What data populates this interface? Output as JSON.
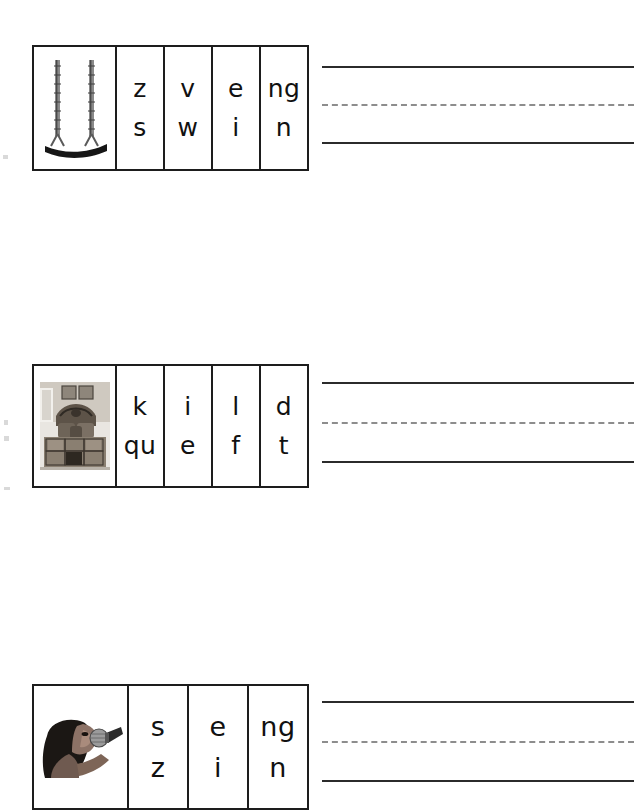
{
  "page": {
    "background_color": "#ffffff",
    "width": 644,
    "height": 812
  },
  "styles": {
    "box_border_color": "#1d1d1d",
    "solid_rule_color": "#2b2b2b",
    "dashed_rule_color": "#8d8d8d",
    "letter_color": "#111111"
  },
  "rows": [
    {
      "id": "row-1",
      "picture": {
        "icon": "swing-photo",
        "alt": "playground swing with chains"
      },
      "answer": "swing",
      "cells": [
        {
          "top": "z",
          "bottom": "s"
        },
        {
          "top": "v",
          "bottom": "w"
        },
        {
          "top": "e",
          "bottom": "i"
        },
        {
          "top": "ng",
          "bottom": "n"
        }
      ],
      "writing_lines": {
        "top": "",
        "middle": "",
        "bottom": ""
      }
    },
    {
      "id": "row-2",
      "picture": {
        "icon": "quilt-bed-photo",
        "alt": "bed with patchwork quilt and pillows"
      },
      "answer": "quilt",
      "cells": [
        {
          "top": "k",
          "bottom": "qu"
        },
        {
          "top": "i",
          "bottom": "e"
        },
        {
          "top": "l",
          "bottom": "f"
        },
        {
          "top": "d",
          "bottom": "t"
        }
      ],
      "writing_lines": {
        "top": "",
        "middle": "",
        "bottom": ""
      }
    },
    {
      "id": "row-3",
      "picture": {
        "icon": "singing-child-photo",
        "alt": "child singing into a microphone"
      },
      "answer": "sing",
      "cells": [
        {
          "top": "s",
          "bottom": "z"
        },
        {
          "top": "e",
          "bottom": "i"
        },
        {
          "top": "ng",
          "bottom": "n"
        }
      ],
      "writing_lines": {
        "top": "",
        "middle": "",
        "bottom": ""
      }
    }
  ]
}
